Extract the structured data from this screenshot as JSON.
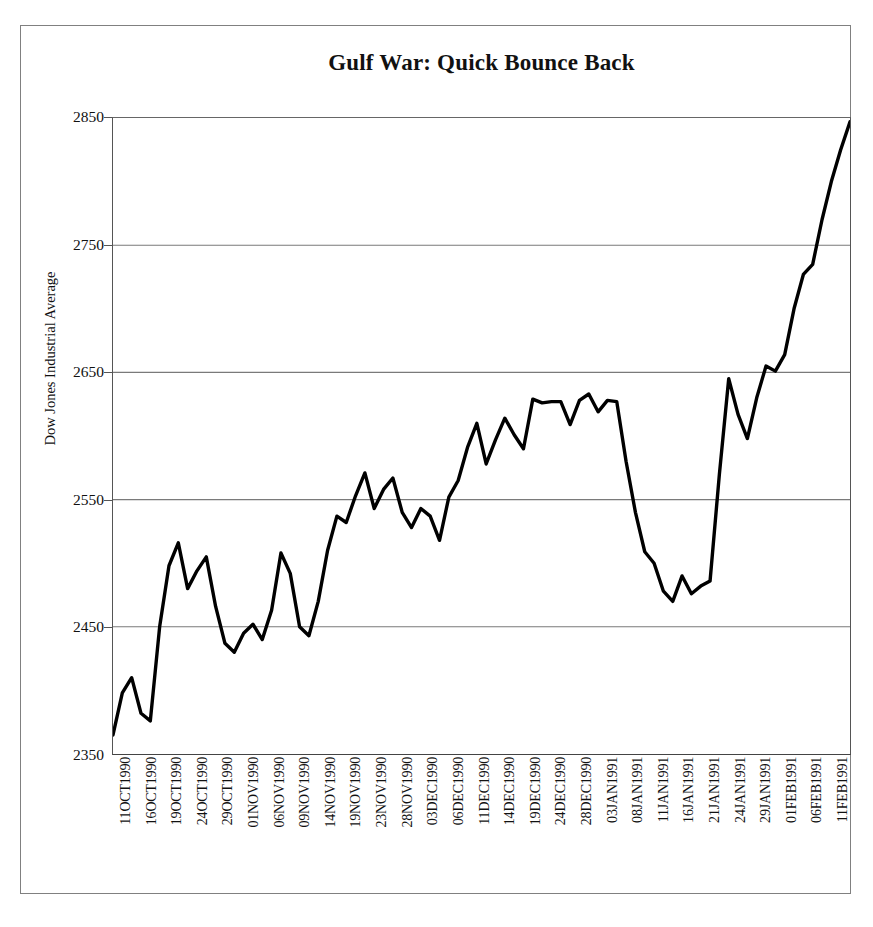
{
  "chart_data": {
    "type": "line",
    "title": "Gulf War: Quick Bounce Back",
    "xlabel": "",
    "ylabel": "Dow Jones Industrial Average",
    "ylim": [
      2350,
      2850
    ],
    "yticks": [
      2350,
      2450,
      2550,
      2650,
      2750,
      2850
    ],
    "grid": true,
    "legend": "none",
    "series_name": "Dow Jones Industrial Average",
    "line_color": "#000000",
    "xtick_labels": [
      "11OCT1990",
      "16OCT1990",
      "19OCT1990",
      "24OCT1990",
      "29OCT1990",
      "01NOV1990",
      "06NOV1990",
      "09NOV1990",
      "14NOV1990",
      "19NOV1990",
      "23NOV1990",
      "28NOV1990",
      "03DEC1990",
      "06DEC1990",
      "11DEC1990",
      "14DEC1990",
      "19DEC1990",
      "24DEC1990",
      "28DEC1990",
      "03JAN1991",
      "08JAN1991",
      "11JAN1991",
      "16JAN1991",
      "21JAN1991",
      "24JAN1991",
      "29JAN1991",
      "01FEB1991",
      "06FEB1991",
      "11FEB1991"
    ],
    "x_start_label": "11OCT1990",
    "x_end_label": "11FEB1991",
    "values": [
      2365,
      2398,
      2410,
      2382,
      2376,
      2450,
      2498,
      2516,
      2480,
      2494,
      2505,
      2466,
      2437,
      2430,
      2445,
      2452,
      2440,
      2463,
      2508,
      2492,
      2450,
      2443,
      2470,
      2510,
      2537,
      2532,
      2553,
      2571,
      2543,
      2558,
      2567,
      2540,
      2528,
      2543,
      2537,
      2518,
      2552,
      2565,
      2591,
      2610,
      2578,
      2597,
      2614,
      2601,
      2590,
      2629,
      2626,
      2627,
      2627,
      2609,
      2628,
      2633,
      2619,
      2628,
      2627,
      2580,
      2540,
      2509,
      2500,
      2478,
      2470,
      2490,
      2476,
      2482,
      2486,
      2570,
      2645,
      2617,
      2598,
      2630,
      2655,
      2651,
      2664,
      2700,
      2727,
      2735,
      2770,
      2800,
      2825,
      2847
    ],
    "peak_value": 2847,
    "trough_value": 2365,
    "annotation": "Sharp decline in early January 1991 followed by a rapid rally after 16JAN1991"
  },
  "page": {
    "background": "#ffffff",
    "border_color": "#808080",
    "axis_color": "#555555",
    "gridline_color": "#7a7a7a"
  }
}
